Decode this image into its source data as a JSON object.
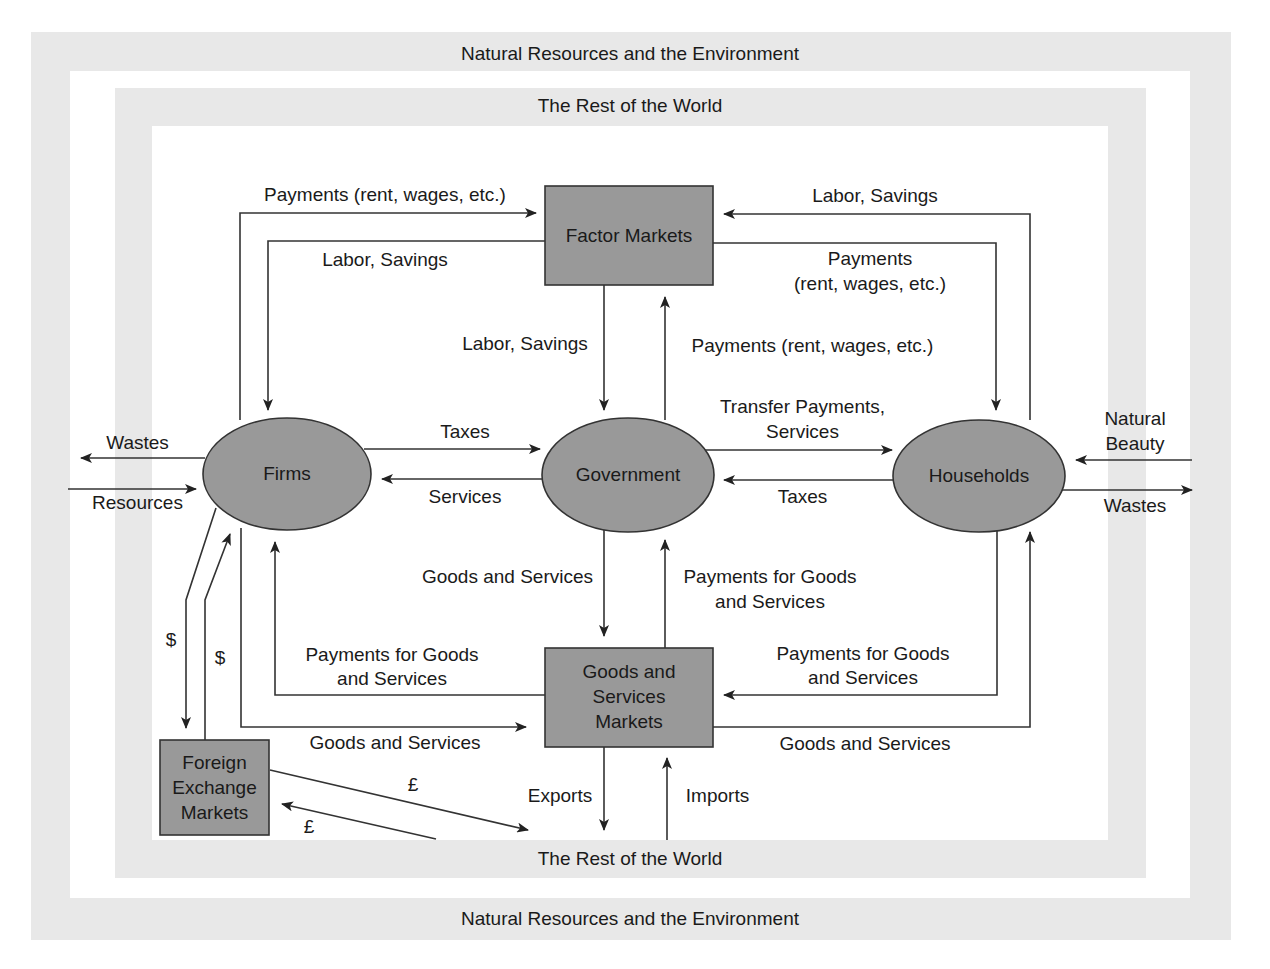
{
  "regions": {
    "outer_top": "Natural Resources and the Environment",
    "outer_bottom": "Natural Resources and the Environment",
    "inner_top": "The Rest of the World",
    "inner_bottom": "The Rest of the World"
  },
  "nodes": {
    "factor_markets": "Factor Markets",
    "firms": "Firms",
    "government": "Government",
    "households": "Households",
    "goods_markets_line1": "Goods and",
    "goods_markets_line2": "Services",
    "goods_markets_line3": "Markets",
    "fx_line1": "Foreign",
    "fx_line2": "Exchange",
    "fx_line3": "Markets"
  },
  "flows": {
    "firms_to_factor_payments": "Payments (rent, wages, etc.)",
    "factor_to_firms_labor": "Labor, Savings",
    "households_to_factor_labor": "Labor, Savings",
    "factor_to_households_payments_1": "Payments",
    "factor_to_households_payments_2": "(rent, wages, etc.)",
    "factor_to_gov_labor": "Labor, Savings",
    "gov_to_factor_payments": "Payments (rent, wages, etc.)",
    "firms_to_gov_taxes": "Taxes",
    "gov_to_firms_services": "Services",
    "gov_to_households_1": "Transfer Payments,",
    "gov_to_households_2": "Services",
    "households_to_gov_taxes": "Taxes",
    "firms_wastes": "Wastes",
    "firms_resources": "Resources",
    "households_natural_beauty_1": "Natural",
    "households_natural_beauty_2": "Beauty",
    "households_wastes": "Wastes",
    "gsm_to_gov_goods": "Goods and Services",
    "gov_to_gsm_payments_1": "Payments for Goods",
    "gov_to_gsm_payments_2": "and Services",
    "gsm_to_firms_payments_1": "Payments for Goods",
    "gsm_to_firms_payments_2": "and Services",
    "firms_to_gsm_goods": "Goods and Services",
    "households_to_gsm_payments_1": "Payments for Goods",
    "households_to_gsm_payments_2": "and Services",
    "gsm_to_households_goods": "Goods and Services",
    "exports": "Exports",
    "imports": "Imports",
    "firms_to_fx_dollar": "$",
    "fx_to_firms_dollar": "$",
    "fx_to_world_pound": "£",
    "world_to_fx_pound": "£"
  },
  "colors": {
    "band": "#e8e8e8",
    "node_fill": "#999999",
    "line": "#333333"
  }
}
